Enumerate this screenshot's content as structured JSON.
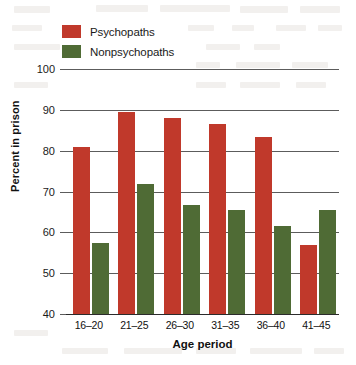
{
  "chart_data": {
    "type": "bar",
    "title": "",
    "subtitle": "",
    "xlabel": "Age period",
    "ylabel": "Percent in prison",
    "categories": [
      "16–20",
      "21–25",
      "26–30",
      "31–35",
      "36–40",
      "41–45"
    ],
    "series": [
      {
        "name": "Psychopaths",
        "color": "#c0392b",
        "values": [
          81,
          89.5,
          88,
          86.5,
          83.3,
          56.8
        ]
      },
      {
        "name": "Nonpsychopaths",
        "color": "#4f6b35",
        "values": [
          57.4,
          71.8,
          66.8,
          65.5,
          61.5,
          65.5
        ]
      }
    ],
    "ylim": [
      40,
      100
    ],
    "yticks": [
      40,
      50,
      60,
      70,
      80,
      90,
      100
    ],
    "ytick_labels": [
      "40",
      "50",
      "60",
      "70",
      "80",
      "90",
      "100"
    ],
    "grid": true,
    "grid_axis": "y",
    "legend_position": "top-left",
    "bar_value_labels": false
  },
  "legend": {
    "items": [
      {
        "label": "Psychopaths",
        "color": "#c0392b"
      },
      {
        "label": "Nonpsychopaths",
        "color": "#4f6b35"
      }
    ]
  },
  "axes": {
    "y_title": "Percent in prison",
    "x_title": "Age period"
  }
}
